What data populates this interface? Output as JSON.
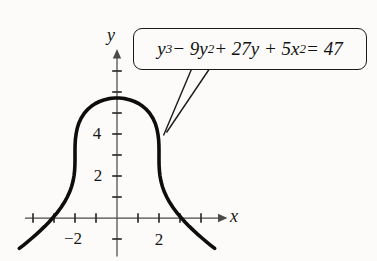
{
  "figure": {
    "background": "#fcfbf9",
    "ink_color": "#161616",
    "axis_color": "#4a4a4a",
    "curve_color": "#0d0d0d"
  },
  "callout": {
    "equation_text": "y³ − 9y² + 27y + 5x² = 47",
    "segments": [
      {
        "text": "y",
        "sup": false
      },
      {
        "text": "3",
        "sup": true
      },
      {
        "text": " − 9y",
        "sup": false
      },
      {
        "text": "2",
        "sup": true
      },
      {
        "text": " + 27y + 5x",
        "sup": false
      },
      {
        "text": "2",
        "sup": true
      },
      {
        "text": " = 47",
        "sup": false
      }
    ]
  },
  "axes": {
    "x_label": "x",
    "y_label": "y",
    "x_tick_labels": [
      {
        "value": -2,
        "label": "−2"
      },
      {
        "value": 2,
        "label": "2"
      }
    ],
    "y_tick_labels": [
      {
        "value": 2,
        "label": "2"
      },
      {
        "value": 4,
        "label": "4"
      }
    ]
  },
  "chart_data": {
    "type": "line",
    "title": "",
    "equation": "y^3 - 9y^2 + 27y + 5x^2 = 47",
    "equation_solved_for_x": "x = ±sqrt((20 - (y - 3)^3) / 5)",
    "xlabel": "x",
    "ylabel": "y",
    "xlim": [
      -4.4,
      5.2
    ],
    "ylim": [
      -2.1,
      8.0
    ],
    "x_ticks": [
      -4,
      -3,
      -2,
      -1,
      1,
      2,
      3,
      4
    ],
    "y_ticks": [
      -1,
      1,
      2,
      3,
      4,
      5,
      6,
      7
    ],
    "labeled_x_ticks": [
      -2,
      2
    ],
    "labeled_y_ticks": [
      2,
      4
    ],
    "grid": false,
    "legend": false,
    "key_points": {
      "maximum": [
        0,
        5.714
      ],
      "x_intercepts": [
        [
          -3.066,
          0
        ],
        [
          3.066,
          0
        ]
      ]
    },
    "curve_points_right_branch": [
      [
        4.65,
        -1.45
      ],
      [
        4.461,
        -1.3
      ],
      [
        4.277,
        -1.15
      ],
      [
        4.099,
        -1.0
      ],
      [
        3.87,
        -0.8
      ],
      [
        3.651,
        -0.6
      ],
      [
        3.444,
        -0.4
      ],
      [
        3.249,
        -0.2
      ],
      [
        3.066,
        0.0
      ],
      [
        2.856,
        0.25
      ],
      [
        2.669,
        0.5
      ],
      [
        2.506,
        0.75
      ],
      [
        2.366,
        1.0
      ],
      [
        2.252,
        1.25
      ],
      [
        2.162,
        1.5
      ],
      [
        2.095,
        1.75
      ],
      [
        2.049,
        2.0
      ],
      [
        2.021,
        2.25
      ],
      [
        2.006,
        2.5
      ],
      [
        2.001,
        2.75
      ],
      [
        2.0,
        3.0
      ],
      [
        1.999,
        3.25
      ],
      [
        1.994,
        3.5
      ],
      [
        1.979,
        3.75
      ],
      [
        1.949,
        4.0
      ],
      [
        1.9,
        4.25
      ],
      [
        1.823,
        4.5
      ],
      [
        1.711,
        4.75
      ],
      [
        1.549,
        5.0
      ],
      [
        1.368,
        5.2
      ],
      [
        1.185,
        5.35
      ],
      [
        1.029,
        5.45
      ],
      [
        0.827,
        5.55
      ],
      [
        0.635,
        5.62
      ],
      [
        0.44,
        5.67
      ],
      [
        0.252,
        5.7
      ],
      [
        0.102,
        5.712
      ],
      [
        0.0,
        5.7144
      ]
    ]
  }
}
